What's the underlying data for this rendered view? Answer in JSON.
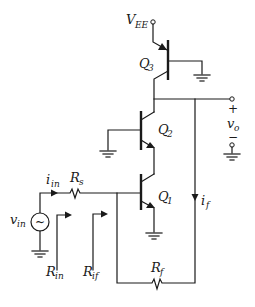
{
  "diagram": {
    "type": "circuit-schematic",
    "title": "",
    "supply": {
      "label": "V",
      "sub": "EE"
    },
    "transistors": [
      {
        "id": "Q3",
        "label": "Q",
        "sub": "3",
        "type": "pnp"
      },
      {
        "id": "Q2",
        "label": "Q",
        "sub": "2",
        "type": "npn"
      },
      {
        "id": "Q1",
        "label": "Q",
        "sub": "1",
        "type": "npn"
      }
    ],
    "resistors": [
      {
        "id": "Rs",
        "label": "R",
        "sub": "s"
      },
      {
        "id": "Rf",
        "label": "R",
        "sub": "f"
      }
    ],
    "source": {
      "label": "v",
      "sub": "in",
      "symbol": "~"
    },
    "currents": [
      {
        "id": "iin",
        "label": "i",
        "sub": "in"
      },
      {
        "id": "if",
        "label": "i",
        "sub": "f"
      }
    ],
    "resistances": [
      {
        "id": "Rin",
        "label": "R",
        "sub": "in"
      },
      {
        "id": "Rif",
        "label": "R",
        "sub": "if"
      }
    ],
    "output": {
      "label": "v",
      "sub": "o",
      "plus": "+",
      "minus": "−"
    }
  }
}
